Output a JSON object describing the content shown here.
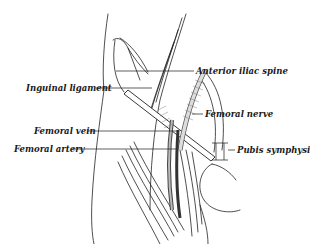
{
  "figure": {
    "labels": {
      "inguinal_ligament": "Inguinal ligament",
      "anterior_iliac_spine": "Anterior iliac spine",
      "femoral_nerve": "Femoral nerve",
      "femoral_vein": "Femoral vein",
      "femoral_artery": "Femoral artery",
      "pubis_symphysis": "Pubis symphysis"
    },
    "colors": {
      "ink": "#1a1a1a",
      "background": "#ffffff"
    }
  }
}
